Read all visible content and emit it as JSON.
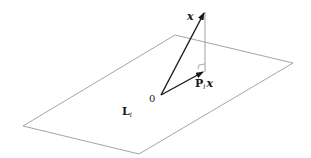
{
  "diagram": {
    "type": "orthogonal-projection",
    "colors": {
      "plane_edge": "#9a9a9a",
      "vector": "#1a1a1a",
      "projection_line": "#8a8a8a",
      "background": "#ffffff"
    },
    "plane": {
      "label_main": "L",
      "label_sub": "i",
      "vertices": [
        [
          175,
          35
        ],
        [
          293,
          63
        ],
        [
          139,
          154
        ],
        [
          23,
          126
        ]
      ]
    },
    "origin": {
      "label": "0",
      "point": [
        161,
        95
      ]
    },
    "vector_x": {
      "label": "x",
      "tip": [
        205,
        12
      ]
    },
    "projection": {
      "label_main": "P",
      "label_sub": "i",
      "label_var": "x",
      "tip": [
        204,
        72
      ]
    },
    "perpendicular": {
      "from": [
        205,
        12
      ],
      "to": [
        205,
        72
      ]
    }
  }
}
